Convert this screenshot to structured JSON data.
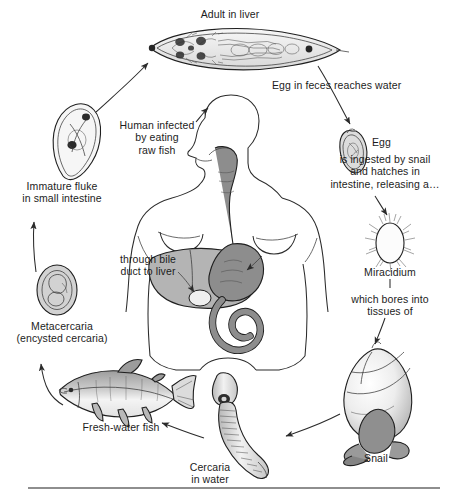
{
  "figure": {
    "kind": "life-cycle-diagram",
    "background_color": "#ffffff",
    "ink_color": "#1c1c1c",
    "organ_fill_liver": "#b4b4b4",
    "organ_fill_gut": "#8d8d8d",
    "rule_color": "#8e8e8e"
  },
  "labels": {
    "adult_in_liver": "Adult in liver",
    "egg_in_feces": "Egg in feces reaches water",
    "egg": "Egg",
    "ingested_by_snail": "is ingested by snail\nand hatches in\nintestine, releasing a…",
    "miracidium": "Miracidium",
    "which_bores": "which bores into\ntissues of",
    "snail": "Snail",
    "cercaria_in_water": "Cercaria\nin water",
    "fresh_water_fish": "Fresh-water fish",
    "metacercaria": "Metacercaria\n(encysted cercaria)",
    "immature_fluke": "Immature fluke\nin small intestine",
    "human_infected": "Human infected\nby eating\nraw fish",
    "through_bile_duct": "through bile\nduct to liver"
  },
  "stages": [
    {
      "id": "adult",
      "name": "Adult in liver",
      "order": 1
    },
    {
      "id": "egg",
      "name": "Egg",
      "order": 2
    },
    {
      "id": "miracidium",
      "name": "Miracidium",
      "order": 3
    },
    {
      "id": "snail",
      "name": "Snail",
      "order": 4
    },
    {
      "id": "cercaria",
      "name": "Cercaria in water",
      "order": 5
    },
    {
      "id": "fish",
      "name": "Fresh-water fish",
      "order": 6
    },
    {
      "id": "metacercaria",
      "name": "Metacercaria",
      "order": 7
    },
    {
      "id": "immature",
      "name": "Immature fluke",
      "order": 8
    }
  ]
}
